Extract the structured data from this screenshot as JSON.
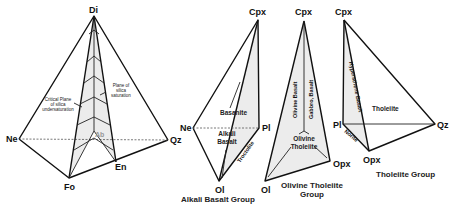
{
  "diagrams": [
    {
      "id": "basalt-tetrahedron",
      "vertices": {
        "top": "Di",
        "left": "Ne",
        "right": "Qz",
        "bottom": "Fo",
        "inner_bottom": "En",
        "center": "Ab"
      },
      "annotations": {
        "critical_plane": [
          "Critical Plane",
          "of silica",
          "undersaturation"
        ],
        "saturation_plane": [
          "Plane of",
          "silica",
          "saturation"
        ]
      }
    },
    {
      "id": "alkali-basalt-group",
      "vertices": {
        "top": "Cpx",
        "left": "Ne",
        "right": "Pl",
        "bottom": "Ol"
      },
      "fields": {
        "basanite": "Basanite",
        "alkali_basalt_1": "Alkali",
        "alkali_basalt_2": "Basalt",
        "troctolite": "Troctolite"
      },
      "group_label": "Alkali Basalt Group"
    },
    {
      "id": "olivine-tholeiite-group",
      "vertices": {
        "top": "Cpx",
        "bottom": "Ol",
        "right": "Opx"
      },
      "fields": {
        "olivine_basalt": "Olivine Basalt",
        "gabbro_basalt": "Gabbro, Basalt",
        "olivine_tholeiite_1": "Olivine",
        "olivine_tholeiite_2": "Tholeiite"
      },
      "group_label_1": "Olivine Tholeiite",
      "group_label_2": "Group"
    },
    {
      "id": "tholeiite-group",
      "vertices": {
        "top": "Cpx",
        "left": "Pl",
        "bottom": "Opx",
        "right": "Qz"
      },
      "fields": {
        "hypersthene_basalt": "Hypersthene Basalt",
        "tholeiite": "Tholeiite",
        "norite": "Norite"
      },
      "group_label": "Tholeiite Group"
    }
  ]
}
